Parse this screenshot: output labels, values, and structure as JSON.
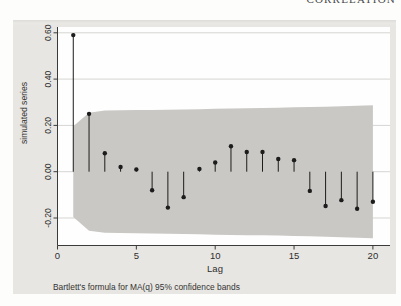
{
  "page": {
    "header_text": "CORRELATION"
  },
  "colors": {
    "figure_bg": "#e8e6e2",
    "plot_bg": "#fefefe",
    "band": "#c9c8c4",
    "gridline": "#d5d5d3",
    "axis": "#3a3a3a",
    "stem": "#1c1c1c",
    "text": "#2e2e2e"
  },
  "chart_data": {
    "type": "stem",
    "subtype": "autocorrelogram",
    "title": "",
    "xlabel": "Lag",
    "ylabel": "simulated series",
    "caption": "Bartlett's formula for MA(q) 95% confidence bands",
    "grid": true,
    "xlim": [
      0,
      21.1
    ],
    "ylim": [
      -0.319,
      0.625
    ],
    "x_ticks": [
      0,
      5,
      10,
      15,
      20
    ],
    "y_ticks": [
      0.6,
      0.4,
      0.2,
      0.0,
      -0.2
    ],
    "y_tick_labels": [
      "0.60",
      "0.40",
      "0.20",
      "0.00",
      "-0.20"
    ],
    "lags": [
      1,
      2,
      3,
      4,
      5,
      6,
      7,
      8,
      9,
      10,
      11,
      12,
      13,
      14,
      15,
      16,
      17,
      18,
      19,
      20
    ],
    "acf": [
      0.59,
      0.25,
      0.08,
      0.02,
      0.01,
      -0.08,
      -0.155,
      -0.11,
      0.012,
      0.04,
      0.11,
      0.085,
      0.085,
      0.055,
      0.05,
      -0.083,
      -0.148,
      -0.123,
      -0.16,
      -0.13
    ],
    "band": {
      "label": "95% confidence band (Bartlett MA(q))",
      "lags": [
        1,
        2,
        3,
        4,
        5,
        6,
        7,
        8,
        9,
        10,
        11,
        12,
        13,
        14,
        15,
        16,
        17,
        18,
        19,
        20
      ],
      "halfwidth": [
        0.196,
        0.255,
        0.264,
        0.265,
        0.266,
        0.267,
        0.268,
        0.269,
        0.27,
        0.272,
        0.273,
        0.274,
        0.275,
        0.276,
        0.278,
        0.279,
        0.281,
        0.283,
        0.285,
        0.287
      ]
    }
  }
}
